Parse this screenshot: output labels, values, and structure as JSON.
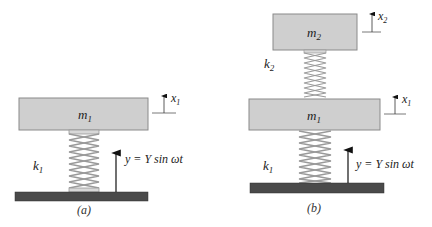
{
  "diagram_a": {
    "caption": "(a)",
    "mass": {
      "label": "m",
      "sub": "1"
    },
    "spring": {
      "label": "k",
      "sub": "1"
    },
    "displacement": {
      "label": "x",
      "sub": "1"
    },
    "base_excitation": "y = Y sin ωt"
  },
  "diagram_b": {
    "caption": "(b)",
    "mass_top": {
      "label": "m",
      "sub": "2"
    },
    "mass_bottom": {
      "label": "m",
      "sub": "1"
    },
    "spring_top": {
      "label": "k",
      "sub": "2"
    },
    "spring_bottom": {
      "label": "k",
      "sub": "1"
    },
    "displacement_top": {
      "label": "x",
      "sub": "2"
    },
    "displacement_bottom": {
      "label": "x",
      "sub": "1"
    },
    "base_excitation": "y = Y sin ωt"
  },
  "colors": {
    "mass_fill": "#cfcfcf",
    "mass_stroke": "#8a8a8a",
    "ground_fill": "#4a4a4a",
    "spring": "#9a9a9a",
    "arrow": "#111111"
  }
}
